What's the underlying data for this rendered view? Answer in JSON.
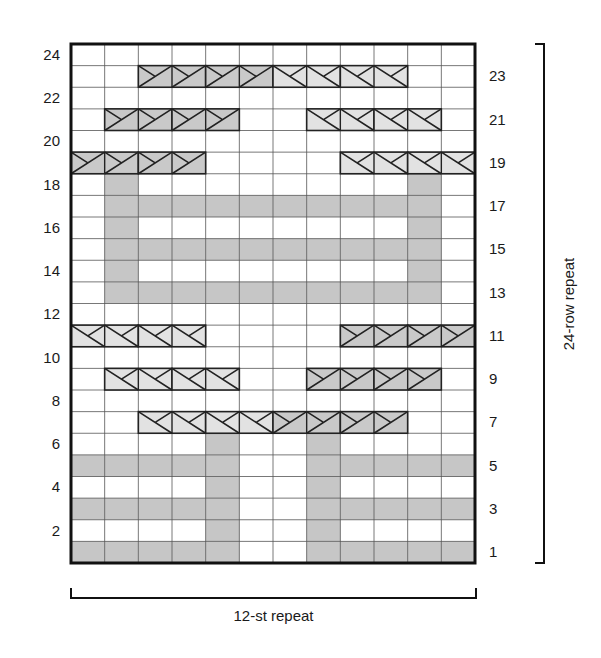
{
  "chart_data": {
    "type": "knitting-chart",
    "columns": 12,
    "rows": 24,
    "colors": {
      "background": "#ffffff",
      "grid_line": "#555555",
      "border": "#111111",
      "shaded": "#c6c6c6",
      "cable_dark": "#c9c9c9",
      "cable_light": "#e2e2e2",
      "cable_line": "#222222"
    },
    "layout": {
      "left": 71,
      "top": 44,
      "right": 475,
      "bottom": 563
    },
    "left_labels": [
      "2",
      "4",
      "6",
      "8",
      "10",
      "12",
      "14",
      "16",
      "18",
      "20",
      "22",
      "24"
    ],
    "right_labels": [
      "1",
      "3",
      "5",
      "7",
      "9",
      "11",
      "13",
      "15",
      "17",
      "19",
      "21",
      "23"
    ],
    "shaded_cells": {
      "1": [
        1,
        2,
        3,
        4,
        5,
        8,
        9,
        10,
        11,
        12
      ],
      "2": [
        5,
        8
      ],
      "3": [
        1,
        2,
        3,
        4,
        5,
        8,
        9,
        10,
        11,
        12
      ],
      "4": [
        5,
        8
      ],
      "5": [
        1,
        2,
        3,
        4,
        5,
        8,
        9,
        10,
        11,
        12
      ],
      "6": [
        5,
        8
      ],
      "13": [
        2,
        3,
        4,
        5,
        6,
        7,
        8,
        9,
        10,
        11
      ],
      "14": [
        2,
        11
      ],
      "15": [
        2,
        3,
        4,
        5,
        6,
        7,
        8,
        9,
        10,
        11
      ],
      "16": [
        2,
        11
      ],
      "17": [
        2,
        3,
        4,
        5,
        6,
        7,
        8,
        9,
        10,
        11
      ],
      "18": [
        2,
        11
      ]
    },
    "cables": [
      {
        "row": 7,
        "start": 3,
        "span": 2,
        "style": "light"
      },
      {
        "row": 7,
        "start": 5,
        "span": 2,
        "style": "light"
      },
      {
        "row": 7,
        "start": 7,
        "span": 2,
        "style": "dark"
      },
      {
        "row": 7,
        "start": 9,
        "span": 2,
        "style": "dark"
      },
      {
        "row": 9,
        "start": 2,
        "span": 2,
        "style": "light"
      },
      {
        "row": 9,
        "start": 4,
        "span": 2,
        "style": "light"
      },
      {
        "row": 9,
        "start": 8,
        "span": 2,
        "style": "dark"
      },
      {
        "row": 9,
        "start": 10,
        "span": 2,
        "style": "dark"
      },
      {
        "row": 11,
        "start": 1,
        "span": 2,
        "style": "light"
      },
      {
        "row": 11,
        "start": 3,
        "span": 2,
        "style": "light"
      },
      {
        "row": 11,
        "start": 9,
        "span": 2,
        "style": "dark"
      },
      {
        "row": 11,
        "start": 11,
        "span": 2,
        "style": "dark"
      },
      {
        "row": 19,
        "start": 1,
        "span": 2,
        "style": "dark"
      },
      {
        "row": 19,
        "start": 3,
        "span": 2,
        "style": "dark"
      },
      {
        "row": 19,
        "start": 9,
        "span": 2,
        "style": "light"
      },
      {
        "row": 19,
        "start": 11,
        "span": 2,
        "style": "light"
      },
      {
        "row": 21,
        "start": 2,
        "span": 2,
        "style": "dark"
      },
      {
        "row": 21,
        "start": 4,
        "span": 2,
        "style": "dark"
      },
      {
        "row": 21,
        "start": 8,
        "span": 2,
        "style": "light"
      },
      {
        "row": 21,
        "start": 10,
        "span": 2,
        "style": "light"
      },
      {
        "row": 23,
        "start": 3,
        "span": 2,
        "style": "dark"
      },
      {
        "row": 23,
        "start": 5,
        "span": 2,
        "style": "dark"
      },
      {
        "row": 23,
        "start": 7,
        "span": 2,
        "style": "light"
      },
      {
        "row": 23,
        "start": 9,
        "span": 2,
        "style": "light"
      }
    ],
    "stitch_repeat_label": "12-st repeat",
    "row_repeat_label": "24-row repeat"
  }
}
